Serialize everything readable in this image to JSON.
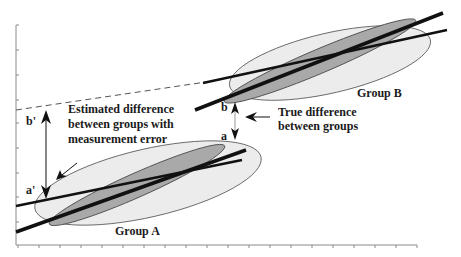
{
  "diagram": {
    "type": "schematic regression diagram",
    "labels": {
      "estimated_line1": "Estimated difference",
      "estimated_line2": "between groups with",
      "estimated_line3": "measurement error",
      "true_line1": "True difference",
      "true_line2": "between groups",
      "group_a": "Group A",
      "group_b": "Group B",
      "b_prime": "b'",
      "a_prime": "a'",
      "b": "b",
      "a": "a"
    },
    "colors": {
      "outer_ellipse_fill": "#ececec",
      "inner_ellipse_fill": "#a9a9a9",
      "line": "#111111",
      "axis": "#8a8a8a",
      "text": "#1a1a1a"
    },
    "axes": {
      "y_tick_count": 9,
      "x_tick_count": 20,
      "tick_labels": "none"
    }
  }
}
